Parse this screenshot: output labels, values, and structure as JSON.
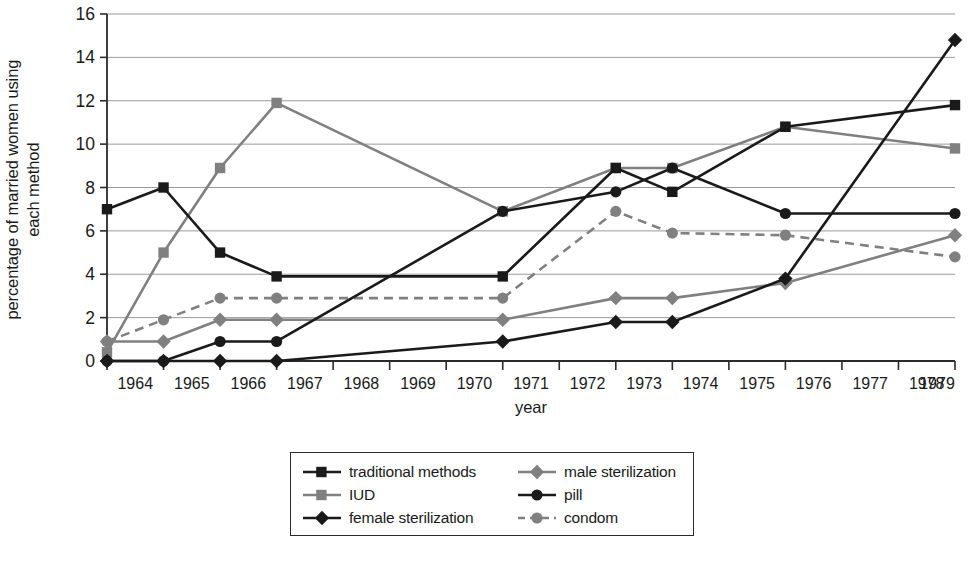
{
  "chart_data": {
    "type": "line",
    "title": "",
    "xlabel": "year",
    "ylabel": "percentage of married women using each method",
    "ylabel_line1": "percentage of married women using",
    "ylabel_line2": "each method",
    "categories": [
      1964,
      1965,
      1966,
      1967,
      1968,
      1969,
      1970,
      1971,
      1972,
      1973,
      1974,
      1975,
      1976,
      1977,
      1978,
      1979
    ],
    "xtick_labels": [
      "1964",
      "1965",
      "1966",
      "1967",
      "1968",
      "1969",
      "1970",
      "1971",
      "1972",
      "1973",
      "1974",
      "1975",
      "1976",
      "1977",
      "1978",
      "1979"
    ],
    "ytick_labels": [
      "0",
      "2",
      "4",
      "6",
      "8",
      "10",
      "12",
      "14",
      "16"
    ],
    "ytick_values": [
      0,
      2,
      4,
      6,
      8,
      10,
      12,
      14,
      16
    ],
    "ylim": [
      0,
      16
    ],
    "xlim": [
      1964,
      1979
    ],
    "grid": true,
    "legend_position": "bottom",
    "series": [
      {
        "name": "traditional methods",
        "color": "#1a1a1a",
        "marker": "square",
        "dashed": false,
        "x": [
          1964,
          1965,
          1966,
          1967,
          1971,
          1973,
          1974,
          1976,
          1979
        ],
        "values": [
          7.0,
          8.0,
          5.0,
          3.9,
          3.9,
          8.9,
          7.8,
          10.8,
          11.8
        ]
      },
      {
        "name": "IUD",
        "color": "#808080",
        "marker": "square",
        "dashed": false,
        "x": [
          1964,
          1965,
          1966,
          1967,
          1971,
          1973,
          1974,
          1976,
          1979
        ],
        "values": [
          0.4,
          5.0,
          8.9,
          11.9,
          6.9,
          8.9,
          8.9,
          10.8,
          9.8
        ]
      },
      {
        "name": "female sterilization",
        "color": "#1a1a1a",
        "marker": "diamond",
        "dashed": false,
        "x": [
          1964,
          1965,
          1966,
          1967,
          1971,
          1973,
          1974,
          1976,
          1979
        ],
        "values": [
          0.0,
          0.0,
          0.0,
          0.0,
          0.9,
          1.8,
          1.8,
          3.8,
          14.8
        ]
      },
      {
        "name": "male sterilization",
        "color": "#808080",
        "marker": "diamond",
        "dashed": false,
        "x": [
          1964,
          1965,
          1966,
          1967,
          1971,
          1973,
          1974,
          1976,
          1979
        ],
        "values": [
          0.9,
          0.9,
          1.9,
          1.9,
          1.9,
          2.9,
          2.9,
          3.6,
          5.8
        ]
      },
      {
        "name": "pill",
        "color": "#1a1a1a",
        "marker": "circle",
        "dashed": false,
        "x": [
          1964,
          1965,
          1966,
          1967,
          1971,
          1973,
          1974,
          1976,
          1979
        ],
        "values": [
          0.0,
          0.0,
          0.9,
          0.9,
          6.9,
          7.8,
          8.9,
          6.8,
          6.8
        ]
      },
      {
        "name": "condom",
        "color": "#808080",
        "marker": "circle",
        "dashed": true,
        "x": [
          1964,
          1965,
          1966,
          1967,
          1971,
          1973,
          1974,
          1976,
          1979
        ],
        "values": [
          0.9,
          1.9,
          2.9,
          2.9,
          2.9,
          6.9,
          5.9,
          5.8,
          4.8
        ]
      }
    ]
  },
  "legend": {
    "items": [
      {
        "label": "traditional methods"
      },
      {
        "label": "male sterilization"
      },
      {
        "label": "IUD"
      },
      {
        "label": "pill"
      },
      {
        "label": "female sterilization"
      },
      {
        "label": "condom"
      }
    ]
  },
  "colors": {
    "dark": "#1a1a1a",
    "gray": "#808080",
    "grid": "#9a9a9a",
    "axis": "#2b2b2b"
  }
}
